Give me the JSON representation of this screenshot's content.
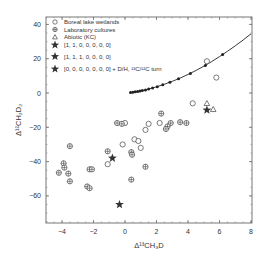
{
  "chart_data": {
    "type": "scatter",
    "title": "",
    "xlabel": "Δ¹³CH₃D",
    "ylabel": "Δ¹²CH₂D₂",
    "xlim": [
      -5,
      8
    ],
    "ylim": [
      -75,
      45
    ],
    "xticks": [
      -4,
      -2,
      0,
      2,
      4,
      6,
      8
    ],
    "yticks": [
      -60,
      -40,
      -20,
      0,
      20,
      40
    ],
    "grid": false,
    "legend_position": "upper left",
    "legend": [
      {
        "marker": "open-circle",
        "label": "Boreal lake wetlands"
      },
      {
        "marker": "circle-plus",
        "label": "Laboratory cultures"
      },
      {
        "marker": "open-triangle",
        "label": "Abiotic (KC)"
      },
      {
        "marker": "star",
        "label": "[1, 1, 0, 0, 0, 0, 0]"
      },
      {
        "marker": "star",
        "label": "[1, 1, 1, 0, 0, 0, 0]"
      },
      {
        "marker": "star",
        "label": "[0, 0, 0, 0, 0, 0, 0] + D/H, ¹³C/¹²C turn"
      }
    ],
    "series": [
      {
        "name": "Equilibrium curve",
        "type": "line",
        "points": [
          [
            0.3,
            0.3
          ],
          [
            0.6,
            0.6
          ],
          [
            1.0,
            1.2
          ],
          [
            1.5,
            2.3
          ],
          [
            2,
            3.6
          ],
          [
            2.5,
            5.1
          ],
          [
            3,
            6.8
          ],
          [
            3.5,
            8.7
          ],
          [
            4,
            10.8
          ],
          [
            4.5,
            13.1
          ],
          [
            5,
            15.6
          ],
          [
            5.5,
            18.3
          ],
          [
            6,
            21.2
          ],
          [
            6.5,
            24.3
          ],
          [
            7,
            27.5
          ],
          [
            7.5,
            30.9
          ],
          [
            8,
            34.5
          ]
        ]
      },
      {
        "name": "Equilibrium markers",
        "type": "filled-dot",
        "points": [
          [
            0.35,
            0.3
          ],
          [
            0.5,
            0.5
          ],
          [
            0.65,
            0.7
          ],
          [
            0.8,
            0.9
          ],
          [
            0.95,
            1.1
          ],
          [
            1.1,
            1.4
          ],
          [
            1.3,
            1.8
          ],
          [
            1.5,
            2.3
          ],
          [
            1.75,
            2.9
          ],
          [
            2.05,
            3.7
          ],
          [
            2.4,
            4.8
          ],
          [
            2.85,
            6.3
          ],
          [
            3.4,
            8.3
          ],
          [
            4.15,
            11.4
          ],
          [
            5.1,
            16.1
          ],
          [
            6.2,
            22.5
          ]
        ]
      },
      {
        "name": "Boreal lake wetlands",
        "type": "open-circle",
        "points": [
          [
            5.2,
            18.5
          ],
          [
            5.8,
            9
          ],
          [
            4.3,
            -6
          ],
          [
            1.5,
            -18
          ],
          [
            2.2,
            -17.5
          ],
          [
            1.3,
            -21.5
          ],
          [
            0.6,
            -27
          ],
          [
            0.85,
            -28
          ],
          [
            -0.15,
            -30
          ],
          [
            1.0,
            -32
          ],
          [
            -1.1,
            -41.5
          ],
          [
            0.0,
            -17.5
          ]
        ]
      },
      {
        "name": "Laboratory cultures",
        "type": "circle-plus",
        "points": [
          [
            -0.5,
            -17.5
          ],
          [
            -0.2,
            -18
          ],
          [
            2.3,
            -12
          ],
          [
            2.9,
            -17.5
          ],
          [
            2.7,
            -19.5
          ],
          [
            2.6,
            -21
          ],
          [
            3.5,
            -17
          ],
          [
            3.9,
            -17.5
          ],
          [
            -3.5,
            -31
          ],
          [
            -1.1,
            -34
          ],
          [
            0.4,
            -34.5
          ],
          [
            0.45,
            -36
          ],
          [
            -3.9,
            -41
          ],
          [
            -3.85,
            -43.5
          ],
          [
            -4.2,
            -46.5
          ],
          [
            -3.6,
            -47
          ],
          [
            -2.25,
            -44.5
          ],
          [
            -2.1,
            -44.5
          ],
          [
            -3.5,
            -51.5
          ],
          [
            -2.4,
            -54.5
          ],
          [
            -2.25,
            -55.5
          ],
          [
            1.3,
            -43
          ],
          [
            0.4,
            -50.5
          ]
        ]
      },
      {
        "name": "Abiotic (KC)",
        "type": "open-triangle",
        "points": [
          [
            5.2,
            -6
          ],
          [
            5.6,
            -9.5
          ]
        ]
      },
      {
        "name": "Stars",
        "type": "star",
        "points": [
          [
            5.2,
            -10
          ],
          [
            -0.8,
            -38
          ],
          [
            -0.35,
            -65
          ]
        ]
      }
    ]
  }
}
